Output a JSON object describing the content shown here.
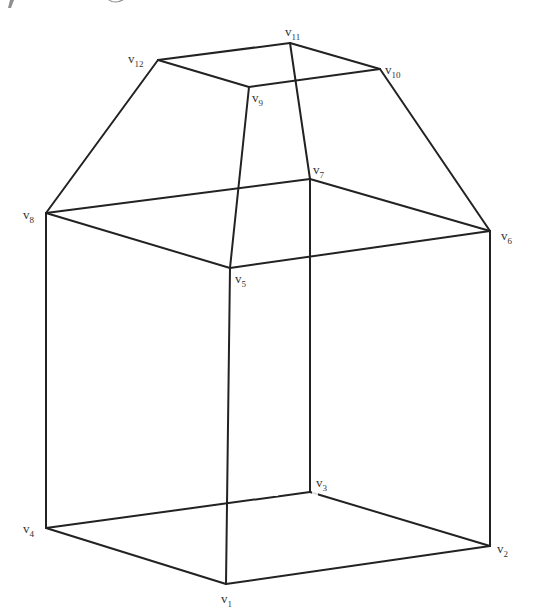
{
  "figure": {
    "stroke_color": "#222222",
    "vertices": [
      {
        "id": "v1",
        "letter": "v",
        "sub": "1",
        "x": 226,
        "y": 584,
        "lx": 221,
        "ly": 603
      },
      {
        "id": "v2",
        "letter": "v",
        "sub": "2",
        "x": 490,
        "y": 546,
        "lx": 497,
        "ly": 553
      },
      {
        "id": "v3",
        "letter": "v",
        "sub": "3",
        "x": 310,
        "y": 492,
        "lx": 316,
        "ly": 487
      },
      {
        "id": "v4",
        "letter": "v",
        "sub": "4",
        "x": 46,
        "y": 528,
        "lx": 23,
        "ly": 533
      },
      {
        "id": "v5",
        "letter": "v",
        "sub": "5",
        "x": 230,
        "y": 268,
        "lx": 235,
        "ly": 283
      },
      {
        "id": "v6",
        "letter": "v",
        "sub": "6",
        "x": 490,
        "y": 231,
        "lx": 501,
        "ly": 240
      },
      {
        "id": "v7",
        "letter": "v",
        "sub": "7",
        "x": 310,
        "y": 179,
        "lx": 313,
        "ly": 174
      },
      {
        "id": "v8",
        "letter": "v",
        "sub": "8",
        "x": 46,
        "y": 213,
        "lx": 23,
        "ly": 219
      },
      {
        "id": "v9",
        "letter": "v",
        "sub": "9",
        "x": 249,
        "y": 87,
        "lx": 252,
        "ly": 102
      },
      {
        "id": "v10",
        "letter": "v",
        "sub": "10",
        "x": 380,
        "y": 69,
        "lx": 385,
        "ly": 74
      },
      {
        "id": "v11",
        "letter": "v",
        "sub": "11",
        "x": 290,
        "y": 43,
        "lx": 285,
        "ly": 36
      },
      {
        "id": "v12",
        "letter": "v",
        "sub": "12",
        "x": 158,
        "y": 60,
        "lx": 128,
        "ly": 63
      }
    ],
    "edges": [
      [
        "v1",
        "v2"
      ],
      [
        "v2",
        "v3"
      ],
      [
        "v3",
        "v4"
      ],
      [
        "v4",
        "v1"
      ],
      [
        "v5",
        "v6"
      ],
      [
        "v6",
        "v7"
      ],
      [
        "v7",
        "v8"
      ],
      [
        "v8",
        "v5"
      ],
      [
        "v1",
        "v5"
      ],
      [
        "v2",
        "v6"
      ],
      [
        "v3",
        "v7"
      ],
      [
        "v4",
        "v8"
      ],
      [
        "v9",
        "v10"
      ],
      [
        "v10",
        "v11"
      ],
      [
        "v11",
        "v12"
      ],
      [
        "v12",
        "v9"
      ],
      [
        "v9",
        "v5"
      ],
      [
        "v10",
        "v6"
      ],
      [
        "v11",
        "v7"
      ],
      [
        "v12",
        "v8"
      ]
    ]
  }
}
